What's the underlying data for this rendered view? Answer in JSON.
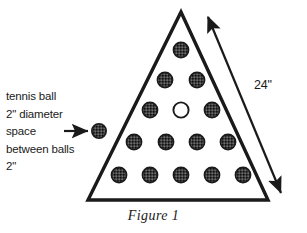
{
  "figure": {
    "caption": "Figure 1",
    "dimension_label": "24\"",
    "callout_lines": [
      "tennis ball",
      "2\" diameter",
      "space",
      "between balls",
      "2\""
    ],
    "colors": {
      "ink": "#1a1a1a",
      "ball_fill": "#3d3d3d",
      "ball_stroke": "#1a1a1a",
      "empty_ball_fill": "#ffffff",
      "background": "#ffffff"
    },
    "triangle": {
      "apex": [
        181,
        12
      ],
      "bottom_left": [
        88,
        200
      ],
      "bottom_right": [
        268,
        200
      ],
      "stroke_width": 3.2
    },
    "sample_ball": {
      "cx": 99,
      "cy": 131,
      "r": 7.2,
      "filled": true
    },
    "arrow": {
      "x1": 63,
      "y1": 131,
      "x2": 90,
      "y2": 131
    },
    "dimension_arrow": {
      "x1": 209,
      "y1": 15,
      "x2": 283,
      "y2": 196,
      "double_headed": true
    },
    "ball_rows": [
      {
        "row": 1,
        "cy": 50,
        "balls": [
          {
            "cx": 181,
            "filled": true
          }
        ]
      },
      {
        "row": 2,
        "cy": 80,
        "balls": [
          {
            "cx": 165,
            "filled": true
          },
          {
            "cx": 197,
            "filled": true
          }
        ]
      },
      {
        "row": 3,
        "cy": 110,
        "balls": [
          {
            "cx": 150,
            "filled": true
          },
          {
            "cx": 181,
            "filled": false
          },
          {
            "cx": 212,
            "filled": true
          }
        ]
      },
      {
        "row": 4,
        "cy": 142,
        "balls": [
          {
            "cx": 134,
            "filled": true
          },
          {
            "cx": 166,
            "filled": true
          },
          {
            "cx": 197,
            "filled": true
          },
          {
            "cx": 228,
            "filled": true
          }
        ]
      },
      {
        "row": 5,
        "cy": 175,
        "balls": [
          {
            "cx": 119,
            "filled": true
          },
          {
            "cx": 150,
            "filled": true
          },
          {
            "cx": 181,
            "filled": true
          },
          {
            "cx": 212,
            "filled": true
          },
          {
            "cx": 243,
            "filled": true
          }
        ]
      }
    ],
    "ball_radius": 7.6
  }
}
